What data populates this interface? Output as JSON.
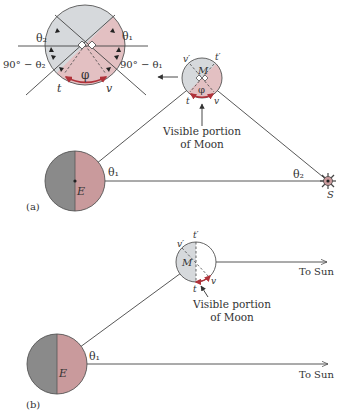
{
  "figure": {
    "colors": {
      "dark_side": "#8a8a8a",
      "lit_side_earth": "#c99a9c",
      "moon_grey": "#d6d9dc",
      "moon_pink": "#e3c0c2",
      "arc_red": "#b0323a",
      "line": "#444444"
    },
    "inset": {
      "labels": {
        "theta2": "θ₂",
        "theta1": "θ₁",
        "ninety_minus_theta2": "90° − θ₂",
        "ninety_minus_theta1": "90° − θ₁",
        "phi": "φ",
        "t": "t",
        "v": "v"
      }
    },
    "panel_a": {
      "label": "(a)",
      "moon": {
        "center_label": "M",
        "t_label": "t",
        "v_label": "v",
        "t_prime_label": "t′",
        "v_prime_label": "v′",
        "phi_label": "φ"
      },
      "visible_portion_line1": "Visible portion",
      "visible_portion_line2": "of Moon",
      "earth_label": "E",
      "theta1": "θ₁",
      "theta2": "θ₂",
      "sun_label": "S"
    },
    "panel_b": {
      "label": "(b)",
      "moon": {
        "center_label": "M",
        "t_label": "t",
        "v_label": "v",
        "t_prime_label": "t′",
        "v_prime_label": "v′"
      },
      "visible_portion_line1": "Visible portion",
      "visible_portion_line2": "of Moon",
      "earth_label": "E",
      "theta1": "θ₁",
      "to_sun_1": "To Sun",
      "to_sun_2": "To Sun"
    }
  }
}
